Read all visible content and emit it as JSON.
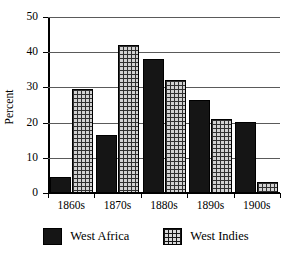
{
  "chart_data": {
    "type": "bar",
    "title": "",
    "subtitle": "",
    "xlabel": "",
    "ylabel": "Percent",
    "categories": [
      "1860s",
      "1870s",
      "1880s",
      "1890s",
      "1900s"
    ],
    "series": [
      {
        "name": "West Africa",
        "values": [
          4.5,
          16.5,
          38.2,
          26.5,
          20.2
        ],
        "color": "#151515",
        "fill": "solid-black"
      },
      {
        "name": "West Indies",
        "values": [
          29.6,
          42.0,
          32.2,
          21.0,
          3.0
        ],
        "color": "#d2d2d2",
        "fill": "cross-hatch"
      }
    ],
    "ylim": [
      0,
      50
    ],
    "ytick_step": 10,
    "yticks": [
      "0",
      "10",
      "20",
      "30",
      "40",
      "50"
    ],
    "grid": "horizontal",
    "legend_position": "bottom",
    "annotations": []
  },
  "legend": {
    "entries": [
      {
        "label": "West Africa",
        "swatch": "solid-black-swatch"
      },
      {
        "label": "West Indies",
        "swatch": "cross-hatch-swatch"
      }
    ]
  }
}
